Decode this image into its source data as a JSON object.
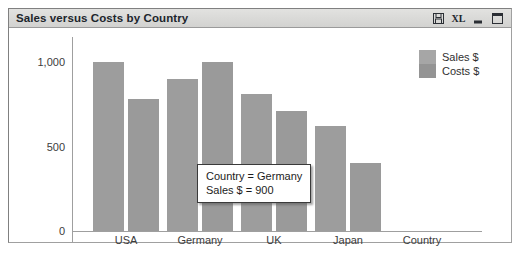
{
  "window": {
    "title": "Sales versus Costs by Country",
    "buttons": [
      {
        "name": "save-icon",
        "label": ""
      },
      {
        "name": "excel-export-icon",
        "label": "XL"
      },
      {
        "name": "minimize-icon",
        "label": ""
      },
      {
        "name": "maximize-icon",
        "label": ""
      }
    ]
  },
  "legend": {
    "entries": [
      {
        "label": "Sales $",
        "color": "#a6a6a6"
      },
      {
        "label": "Costs $",
        "color": "#949494"
      }
    ]
  },
  "tooltip": {
    "line1": "Country = Germany",
    "line2": "Sales $ = 900"
  },
  "chart_data": {
    "type": "bar",
    "title": "Sales versus Costs by Country",
    "xlabel": "Country",
    "ylabel": "",
    "categories": [
      "USA",
      "Germany",
      "UK",
      "Japan"
    ],
    "series": [
      {
        "name": "Sales $",
        "color": "#9d9d9d",
        "values": [
          1000,
          900,
          810,
          620
        ]
      },
      {
        "name": "Costs $",
        "color": "#9a9a9a",
        "values": [
          780,
          1000,
          710,
          405
        ]
      }
    ],
    "ylim": [
      0,
      1150
    ],
    "yticks": [
      0,
      500,
      1000
    ],
    "ytick_labels": [
      "0",
      "500",
      "1,000"
    ],
    "grid": false,
    "legend_position": "top-right",
    "annotations": [
      {
        "text": "Country = Germany; Sales $ = 900",
        "target_category": "Germany",
        "target_series": "Sales $"
      }
    ]
  }
}
